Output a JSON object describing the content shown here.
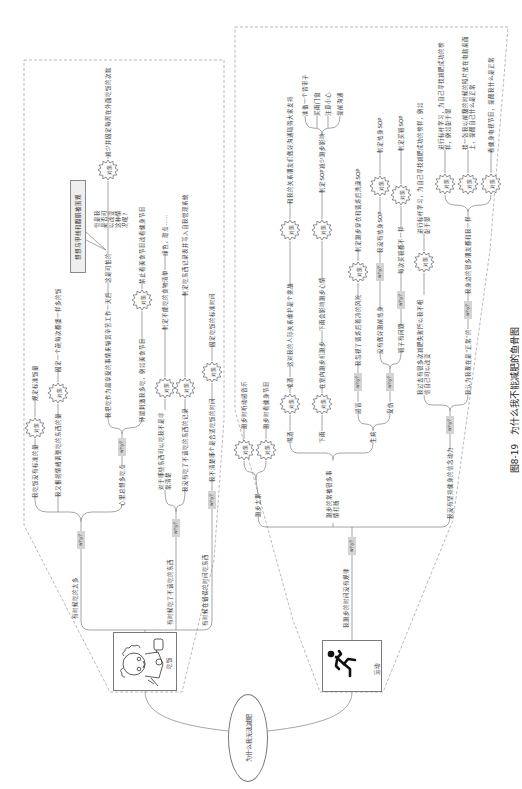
{
  "caption": {
    "figure_no": "图8-19",
    "title": "为什么我不能减肥的鱼骨图"
  },
  "root": {
    "problem": "为什么我无法减肥"
  },
  "tags": {
    "why": "why?",
    "countermeasure": "对策"
  },
  "eating": {
    "category": "吃饭",
    "bones": [
      {
        "cause": "有时候吃的太多",
        "reasons": [
          {
            "reason": "我吃饭没有标准的量",
            "countermeasure": "规定标准饭量"
          },
          {
            "reason": "我又根据情绪调整吃的东西的量",
            "countermeasure": "固定一个碗每次都盛一样多的饭"
          },
          {
            "reason": "心里总想多吃点",
            "sub_reasons": [
              {
                "reason": "我把吃作为最享受的事情来犒赏辛苦工作一天后",
                "consequence": "这是可怕的",
                "callout": "想想马甲线和腹肌被围观",
                "note": "但是我是否可以改变这种情况呢?",
                "countermeasure": "减少并固定每周在外面吃饭的次数"
              },
              {
                "reason": "环境刺激我多吃，例如美食节目",
                "countermeasure": "禁止看美食节目改看健身节目"
              }
            ]
          }
        ]
      },
      {
        "cause": "有时候吃了不该吃的东西",
        "reasons": [
          {
            "reason": "对于哪些东西可以吃我不是非常清楚",
            "countermeasure": "制定不能吃的食物清单",
            "example": "绿色，甜点……"
          },
          {
            "reason": "我没有吃了不该吃的东西的记录",
            "countermeasure": "制定吃东西记录表并写入自我管理系统"
          }
        ]
      },
      {
        "cause": "有时候在错误的时间吃东西",
        "reasons": [
          {
            "reason": "我不清楚哪个是合适吃饭的时间",
            "countermeasure": "固定吃饭的标准时间"
          }
        ]
      }
    ]
  },
  "exercise": {
    "category": "运动",
    "cause": "我跑步的时间没有规律",
    "bones": [
      {
        "reason": "跑步太累",
        "countermeasures": [
          "跑步时听动感音乐",
          "跑步时看健身节目"
        ]
      },
      {
        "reason": "跑步的常被很多事情打断",
        "sub_reasons": [
          {
            "reason": "喝酒",
            "countermeasure": "戒酒",
            "consequence": "这对我的人际关系维护是个挑战",
            "countermeasure2": "和我的关系朋友们做好沟通取得大家支持"
          },
          {
            "reason": "下雨",
            "countermeasure": "在室内跑步机跑步",
            "consequence": "下雨会影响跑步心情",
            "countermeasure2": "制定SOP减少跑步影响",
            "sop_items": [
              "准备一个背带子",
              "买雨门窗",
              "注意小心",
              "提前沟通"
            ]
          },
          {
            "reason": "生病",
            "sub_reasons": [
              {
                "reason": "感冒",
                "why": "我忽视了锻炼后着凉的风险",
                "countermeasure": "制定跑步穿衣和锻炼后洗澡SOP"
              },
              {
                "reason": "受伤",
                "sub_reasons": [
                  {
                    "reason": "没有做好跑前热身",
                    "why": "我没有热身SOP",
                    "countermeasure": "制定热身SOP"
                  },
                  {
                    "reason": "鞋子有问题",
                    "why": "每次买鞋都不一样",
                    "countermeasure": "制定买鞋SOP"
                  }
                ]
              }
            ]
          }
        ]
      },
      {
        "reason": "我没有坚持健身的信念动力",
        "sub_reasons": [
          {
            "reason": "我过去有很多次减肥失败所以我不相信自己可以改变",
            "countermeasure": "进行标杆学习，为自己寻找减肥成功的榜样，例如彭于晏"
          },
          {
            "reason": "我认为我现在是“正常”的",
            "why": "我身边的很多朋友都和我一样",
            "countermeasures": [
              "进行标杆学习，为自己寻找减肥成功的榜样，例如彭于晏",
              "找一张我以前瘦的时候的照片放在电脑桌面上，提醒自己什么是正常",
              "看健身电视节目，提醒我什么是正常"
            ]
          }
        ]
      }
    ]
  }
}
